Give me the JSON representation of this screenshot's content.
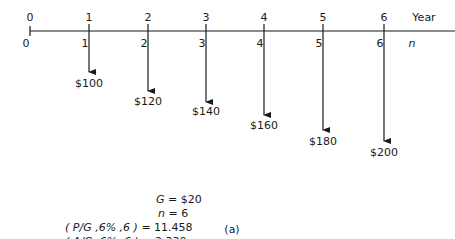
{
  "diagram": {
    "axis_top_label": "Year",
    "axis_bottom_label": "n",
    "periods": [
      {
        "year": "0",
        "n": "0",
        "x": 30,
        "amount": null,
        "tip_y": null,
        "amount_y": null
      },
      {
        "year": "1",
        "n": "1",
        "x": 89,
        "amount": "$100",
        "tip_y": 72,
        "amount_y": 78
      },
      {
        "year": "2",
        "n": "2",
        "x": 148,
        "amount": "$120",
        "tip_y": 91,
        "amount_y": 96
      },
      {
        "year": "3",
        "n": "3",
        "x": 206,
        "amount": "$140",
        "tip_y": 102,
        "amount_y": 106
      },
      {
        "year": "4",
        "n": "4",
        "x": 264,
        "amount": "$160",
        "tip_y": 115,
        "amount_y": 120
      },
      {
        "year": "5",
        "n": "5",
        "x": 323,
        "amount": "$180",
        "tip_y": 130,
        "amount_y": 136
      },
      {
        "year": "6",
        "n": "6",
        "x": 384,
        "amount": "$200",
        "tip_y": 141,
        "amount_y": 147
      }
    ],
    "equations": {
      "G": {
        "var": "G",
        "value": "= $20"
      },
      "n": {
        "var": "n",
        "value": "= 6"
      },
      "PG": {
        "text": "( P/G ,6% ,6 )",
        "value": "= 11.458"
      },
      "AG": {
        "text": "( A/G ,6% ,6 )",
        "value": "= 2.330"
      }
    },
    "caption": "(a)",
    "colors": {
      "ink": "#1a1a1a",
      "background": "#ffffff"
    }
  }
}
